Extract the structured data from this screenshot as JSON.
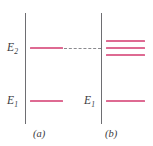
{
  "figure": {
    "type": "energy-level-diagram",
    "width": 153,
    "height": 146,
    "background": "#ffffff",
    "level_color": "#de6a92",
    "axis_color": "#6e6e72",
    "dash_color": "#8a8a8e",
    "text_color": "#3a3a3e"
  },
  "panel_a": {
    "caption": "(a)",
    "labels": {
      "upper": "E",
      "upper_sub": "2",
      "lower": "E",
      "lower_sub": "1"
    },
    "levels": [
      {
        "name": "E2",
        "y": 48,
        "x1": 30,
        "x2": 63
      },
      {
        "name": "E1",
        "y": 101,
        "x1": 30,
        "x2": 63
      }
    ],
    "axis": {
      "x": 25,
      "y1": 13,
      "y2": 124
    }
  },
  "panel_b": {
    "caption": "(b)",
    "labels": {
      "lower": "E",
      "lower_sub": "1"
    },
    "levels": [
      {
        "name": "E2-split-upper",
        "y": 41,
        "x1": 106,
        "x2": 145
      },
      {
        "name": "E2-split-middle",
        "y": 48,
        "x1": 106,
        "x2": 145
      },
      {
        "name": "E2-split-lower",
        "y": 55,
        "x1": 106,
        "x2": 145
      },
      {
        "name": "E1",
        "y": 101,
        "x1": 106,
        "x2": 145
      }
    ],
    "axis": {
      "x": 101,
      "y1": 13,
      "y2": 124
    }
  },
  "connector": {
    "name": "dashed-reference-line",
    "y": 48,
    "x1": 64,
    "x2": 101,
    "style": "dashed"
  }
}
